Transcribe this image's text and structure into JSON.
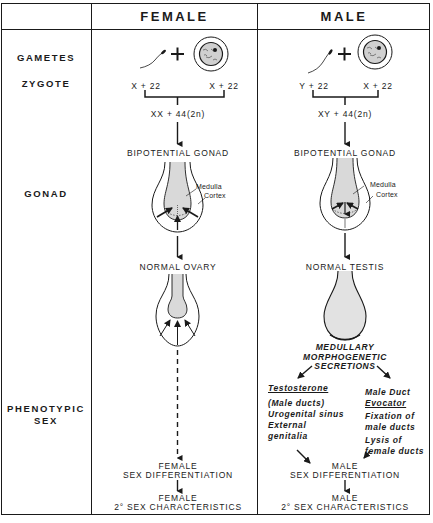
{
  "columns": {
    "female": "FEMALE",
    "male": "MALE"
  },
  "rows": {
    "gametes": "GAMETES",
    "zygote": "ZYGOTE",
    "gonad": "GONAD",
    "phenotypic_sex_line1": "PHENOTYPIC",
    "phenotypic_sex_line2": "SEX"
  },
  "female": {
    "sperm_chromosomes": "X + 22",
    "egg_chromosomes": "X + 22",
    "zygote": "XX + 44(2n)",
    "bipotential_gonad": "BIPOTENTIAL GONAD",
    "medulla_label": "Medulla",
    "cortex_label": "Cortex",
    "gonad_result": "NORMAL OVARY",
    "sex_diff_line1": "FEMALE",
    "sex_diff_line2": "SEX DIFFERENTIATION",
    "secondary_line1": "FEMALE",
    "secondary_line2": "2° SEX CHARACTERISTICS"
  },
  "male": {
    "sperm_chromosomes": "Y + 22",
    "egg_chromosomes": "X + 22",
    "zygote": "XY + 44(2n)",
    "bipotential_gonad": "BIPOTENTIAL GONAD",
    "medulla_label": "Medulla",
    "cortex_label": "Cortex",
    "gonad_result": "NORMAL TESTIS",
    "secretions_line1": "MEDULLARY",
    "secretions_line2": "MORPHOGENETIC",
    "secretions_line3": "SECRETIONS",
    "testosterone": {
      "title": "Testosterone",
      "line1": "(Male ducts)",
      "line2": "Urogenital sinus",
      "line3": "External",
      "line4": "genitalia"
    },
    "duct_evocator": {
      "title_line1": "Male Duct",
      "title_line2": "Evocator",
      "line1": "Fixation of",
      "line2": "male ducts",
      "line3": "Lysis of",
      "line4": "female ducts"
    },
    "sex_diff_line1": "MALE",
    "sex_diff_line2": "SEX DIFFERENTIATION",
    "secondary_line1": "MALE",
    "secondary_line2": "2° SEX CHARACTERISTICS"
  },
  "icons": {
    "sperm": "sperm-icon",
    "egg": "egg-cell-icon",
    "plus": "+",
    "arrow": "arrow-down-icon"
  },
  "colors": {
    "line": "#1a1a1a",
    "gonad_fill": "#d9d9d9",
    "background": "#ffffff"
  }
}
